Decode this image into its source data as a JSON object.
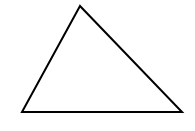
{
  "diagram": {
    "shape": "triangle",
    "vertices": [
      [
        80,
        6
      ],
      [
        22,
        112
      ],
      [
        182,
        112
      ]
    ],
    "stroke_color": "#000000",
    "fill_color": "#ffffff",
    "stroke_width": 2
  }
}
